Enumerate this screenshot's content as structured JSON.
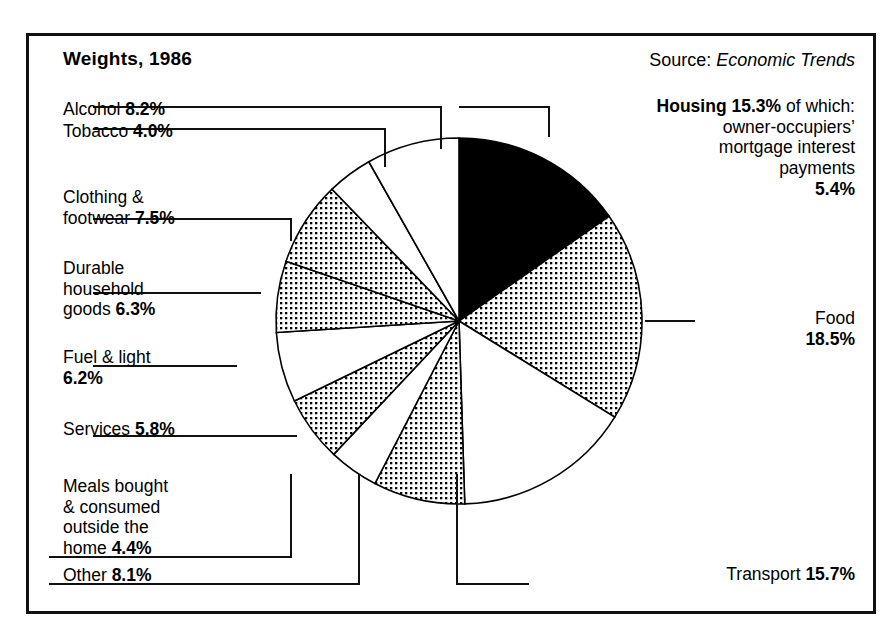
{
  "header": {
    "title": "Weights, 1986",
    "source_prefix": "Source: ",
    "source_name": "Economic Trends"
  },
  "labels": {
    "alcohol": {
      "name": "Alcohol ",
      "value": "8.2%"
    },
    "tobacco": {
      "name": "Tobacco ",
      "value": "4.0%"
    },
    "clothing": {
      "name": "Clothing &\nfootwear ",
      "value": "7.5%"
    },
    "durable": {
      "name": "Durable\nhousehold\ngoods ",
      "value": "6.3%"
    },
    "fuel": {
      "name": "Fuel & light\n",
      "value": "6.2%"
    },
    "services": {
      "name": "Services ",
      "value": "5.8%"
    },
    "meals": {
      "name": "Meals bought\n& consumed\noutside the\nhome ",
      "value": "4.4%"
    },
    "other": {
      "name": "Other ",
      "value": "8.1%"
    },
    "housing": {
      "name": "Housing ",
      "value": "15.3%",
      "note": " of which:\nowner-occupiers’\nmortgage interest\npayments\n",
      "sub_value": "5.4%"
    },
    "food": {
      "name": "Food\n",
      "value": "18.5%"
    },
    "transport": {
      "name": "Transport ",
      "value": "15.7%"
    }
  },
  "chart_data": {
    "type": "pie",
    "title": "Weights, 1986",
    "units": "percent",
    "total": 100.0,
    "start_angle_deg": 0,
    "direction": "clockwise",
    "note": "Slices begin at 12 o'clock and run clockwise. Fill styles: solid black, dotted halftone, or white, alternating.",
    "legend_position": "around-chart",
    "categories": [
      "Housing",
      "Food",
      "Transport",
      "Other",
      "Meals bought & consumed outside the home",
      "Services",
      "Fuel & light",
      "Durable household goods",
      "Clothing & footwear",
      "Tobacco",
      "Alcohol"
    ],
    "values": [
      15.3,
      18.5,
      15.7,
      8.1,
      4.4,
      5.8,
      6.2,
      6.3,
      7.5,
      4.0,
      8.2
    ],
    "fills": [
      "solid",
      "dotted",
      "white",
      "dotted",
      "white",
      "dotted",
      "white",
      "dotted",
      "dotted",
      "white",
      "white"
    ],
    "subcomponents": [
      {
        "parent": "Housing",
        "name": "owner-occupiers’ mortgage interest payments",
        "value": 5.4
      }
    ]
  },
  "colors": {
    "ink": "#000000",
    "paper": "#ffffff",
    "frame": "#111111"
  }
}
